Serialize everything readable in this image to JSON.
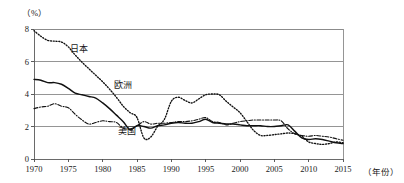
{
  "chart_data": {
    "type": "line",
    "title": "",
    "subtitle": "",
    "xlabel": "（年份）",
    "ylabel": "（%）",
    "xlim": [
      1970,
      2015
    ],
    "ylim": [
      0,
      8
    ],
    "grid": true,
    "grid_axis": "y",
    "legend_position": "inline-annotations",
    "x_ticks": [
      1970,
      1975,
      1980,
      1985,
      1990,
      1995,
      2000,
      2005,
      2010,
      2015
    ],
    "x_tick_labels": [
      "1970",
      "1975",
      "1980",
      "1985",
      "1990",
      "1995",
      "2000",
      "2005",
      "2010",
      "2015"
    ],
    "y_ticks": [
      0,
      2,
      4,
      6,
      8
    ],
    "y_tick_labels": [
      "0",
      "2",
      "4",
      "6",
      "8"
    ],
    "x": [
      1970,
      1971,
      1972,
      1973,
      1974,
      1975,
      1976,
      1977,
      1978,
      1979,
      1980,
      1981,
      1982,
      1983,
      1984,
      1985,
      1986,
      1987,
      1988,
      1989,
      1990,
      1991,
      1992,
      1993,
      1994,
      1995,
      1996,
      1997,
      1998,
      1999,
      2000,
      2001,
      2002,
      2003,
      2004,
      2005,
      2006,
      2007,
      2008,
      2009,
      2010,
      2011,
      2012,
      2013,
      2014,
      2015
    ],
    "series": [
      {
        "name": "日本",
        "label": "日本",
        "style": "dotted",
        "color": "#111111",
        "label_x": 1976.5,
        "label_y": 6.6,
        "values": [
          7.9,
          7.55,
          7.3,
          7.25,
          7.2,
          6.9,
          6.4,
          5.95,
          5.55,
          5.15,
          4.75,
          4.3,
          3.8,
          3.25,
          2.85,
          2.55,
          1.3,
          1.35,
          2.0,
          2.45,
          3.55,
          3.8,
          3.6,
          3.45,
          3.7,
          3.95,
          4.0,
          3.95,
          3.55,
          3.2,
          2.85,
          2.3,
          1.75,
          1.45,
          1.45,
          1.5,
          1.55,
          1.6,
          1.55,
          1.4,
          1.05,
          0.95,
          0.9,
          0.95,
          1.05,
          1.0
        ]
      },
      {
        "name": "欧洲",
        "label": "欧洲",
        "style": "solid",
        "color": "#111111",
        "label_x": 1983.0,
        "label_y": 4.35,
        "values": [
          4.9,
          4.85,
          4.7,
          4.7,
          4.6,
          4.35,
          4.05,
          3.95,
          3.85,
          3.75,
          3.45,
          3.1,
          2.7,
          2.3,
          1.8,
          2.05,
          2.0,
          1.9,
          2.05,
          2.1,
          2.2,
          2.25,
          2.2,
          2.2,
          2.3,
          2.45,
          2.25,
          2.2,
          2.15,
          2.15,
          2.1,
          2.05,
          2.05,
          2.05,
          2.0,
          2.0,
          2.05,
          2.1,
          1.7,
          1.3,
          1.2,
          1.25,
          1.2,
          1.1,
          1.0,
          0.95
        ]
      },
      {
        "name": "美国",
        "label": "美国",
        "style": "dashdot",
        "color": "#111111",
        "label_x": 1983.5,
        "label_y": 1.55,
        "values": [
          3.1,
          3.2,
          3.25,
          3.4,
          3.25,
          3.15,
          2.75,
          2.4,
          2.15,
          2.25,
          2.35,
          2.3,
          2.25,
          1.9,
          1.85,
          2.05,
          2.3,
          2.15,
          2.2,
          2.2,
          2.25,
          2.3,
          2.3,
          2.35,
          2.45,
          2.55,
          2.3,
          2.25,
          2.1,
          2.2,
          2.3,
          2.35,
          2.4,
          2.4,
          2.4,
          2.4,
          2.35,
          1.85,
          1.55,
          1.45,
          1.4,
          1.45,
          1.4,
          1.35,
          1.25,
          1.15
        ]
      }
    ]
  }
}
